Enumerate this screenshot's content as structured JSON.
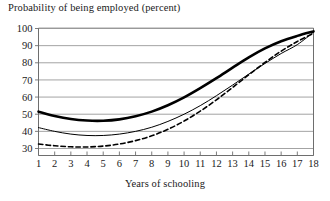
{
  "chart_data": {
    "type": "line",
    "title": "Probability of being employed (percent)",
    "xlabel": "Years of schooling",
    "ylabel": "",
    "x": [
      1,
      2,
      3,
      4,
      5,
      6,
      7,
      8,
      9,
      10,
      11,
      12,
      13,
      14,
      15,
      16,
      17,
      18
    ],
    "xlim": [
      1,
      18
    ],
    "ylim": [
      27,
      100
    ],
    "xticks": [
      "1",
      "2",
      "3",
      "4",
      "5",
      "6",
      "7",
      "8",
      "9",
      "10",
      "11",
      "12",
      "13",
      "14",
      "15",
      "16",
      "17",
      "18"
    ],
    "yticks": [
      "30",
      "40",
      "50",
      "60",
      "70",
      "80",
      "90",
      "100"
    ],
    "ytick_values": [
      30,
      40,
      50,
      60,
      70,
      80,
      90,
      100
    ],
    "grid": "horizontal",
    "legend": "none",
    "series": [
      {
        "name": "thick-solid-curve",
        "style": "solid",
        "width": 2.6,
        "color": "#000000",
        "values": [
          51.5,
          49.0,
          47.2,
          46.3,
          46.2,
          47.0,
          48.8,
          51.5,
          55.2,
          59.8,
          65.2,
          71.0,
          77.2,
          83.2,
          88.4,
          92.6,
          95.7,
          98.3
        ]
      },
      {
        "name": "thin-solid-curve",
        "style": "solid",
        "width": 1.0,
        "color": "#000000",
        "values": [
          42.2,
          40.0,
          38.4,
          37.6,
          37.6,
          38.4,
          40.0,
          42.4,
          45.8,
          50.0,
          55.0,
          60.8,
          67.0,
          73.4,
          79.6,
          85.4,
          90.6,
          97.8
        ]
      },
      {
        "name": "dashed-curve",
        "style": "dashed",
        "width": 1.6,
        "color": "#000000",
        "values": [
          32.6,
          31.6,
          31.0,
          30.9,
          31.4,
          32.6,
          34.6,
          37.4,
          41.2,
          46.0,
          51.8,
          58.4,
          65.6,
          73.0,
          80.2,
          86.8,
          92.4,
          97.2
        ]
      }
    ],
    "colors": {
      "grid": "#8c8c8c",
      "axis": "#6e6e6e",
      "text": "#1a1a1a",
      "background": "#ffffff"
    }
  }
}
